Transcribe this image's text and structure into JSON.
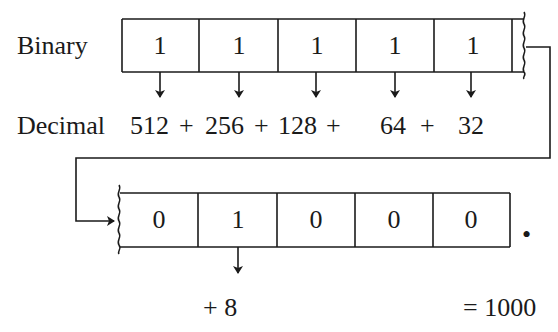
{
  "labels": {
    "binary": "Binary",
    "decimal": "Decimal"
  },
  "top_register": {
    "bits": [
      "1",
      "1",
      "1",
      "1",
      "1"
    ],
    "decimal_terms": [
      "512",
      "+",
      "256",
      "+",
      "128",
      "+",
      "64",
      "+",
      "32"
    ]
  },
  "bottom_register": {
    "bits": [
      "0",
      "1",
      "0",
      "0",
      "0"
    ],
    "decimal_term": "+ 8",
    "binary_point": "•"
  },
  "result": "= 1000",
  "colors": {
    "ink": "#1a1a1a",
    "background": "#ffffff"
  }
}
